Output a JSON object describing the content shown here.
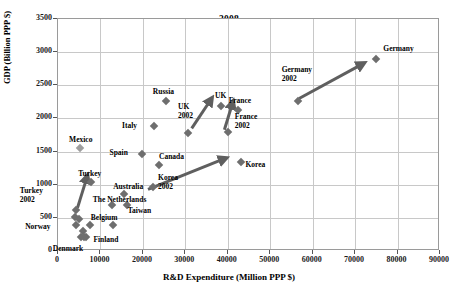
{
  "chart_data": {
    "type": "scatter",
    "title": "2008",
    "xlabel": "R&D Expenditure (Million PPP $)",
    "ylabel": "GDP (Billion PPP $)",
    "xlim": [
      0,
      90000
    ],
    "ylim": [
      0,
      3500
    ],
    "xticks": [
      0,
      10000,
      20000,
      30000,
      40000,
      50000,
      60000,
      70000,
      80000,
      90000
    ],
    "yticks": [
      0,
      500,
      1000,
      1500,
      2000,
      2500,
      3000,
      3500
    ],
    "grid": true,
    "legend": "none",
    "marker_color": "#6e6e6e",
    "arrow_color": "#5f5f5f",
    "points": [
      {
        "label": "Germany",
        "x": 75000,
        "y": 2900,
        "label_dx": 8,
        "label_dy": -14
      },
      {
        "label": "Germany\n2002",
        "x": 56500,
        "y": 2270,
        "label_dx": -6,
        "label_dy": -26
      },
      {
        "label": "France",
        "x": 42500,
        "y": 2130,
        "label_dx": -2,
        "label_dy": -13
      },
      {
        "label": "France\n2002",
        "x": 40000,
        "y": 1790,
        "label_dx": 8,
        "label_dy": -10
      },
      {
        "label": "UK",
        "x": 38500,
        "y": 2190,
        "label_dx": -2,
        "label_dy": -14
      },
      {
        "label": "UK\n2002",
        "x": 30500,
        "y": 1780,
        "label_dx": -4,
        "label_dy": -21
      },
      {
        "label": "Russia",
        "x": 25500,
        "y": 2260,
        "label_dx": -6,
        "label_dy": -13
      },
      {
        "label": "Italy",
        "x": 22500,
        "y": 1880,
        "label_dx": -26,
        "label_dy": -4
      },
      {
        "label": "Spain",
        "x": 19800,
        "y": 1470,
        "label_dx": -26,
        "label_dy": -5
      },
      {
        "label": "Canada",
        "x": 23800,
        "y": 1300,
        "label_dx": 1,
        "label_dy": -12
      },
      {
        "label": "Korea",
        "x": 43000,
        "y": 1350,
        "label_dx": 6,
        "label_dy": -1
      },
      {
        "label": "Korea\n2002",
        "x": 22400,
        "y": 960,
        "label_dx": 6,
        "label_dy": -4
      },
      {
        "label": "Turkey",
        "x": 7800,
        "y": 1040,
        "label_dx": -5,
        "label_dy": -12
      },
      {
        "label": "Turkey\n2002",
        "x": 4200,
        "y": 620,
        "label_dx": -48,
        "label_dy": -14
      },
      {
        "label": "Mexico",
        "x": 5200,
        "y": 1550,
        "label_dx": -3,
        "label_dy": -12
      },
      {
        "label": "Australia",
        "x": 15600,
        "y": 860,
        "label_dx": -1,
        "label_dy": -11
      },
      {
        "label": "The Netherlands",
        "x": 12700,
        "y": 700,
        "label_dx": -2,
        "label_dy": -9
      },
      {
        "label": "Taiwan",
        "x": 16200,
        "y": 700,
        "label_dx": 2,
        "label_dy": 2
      },
      {
        "label": "Belgium",
        "x": 7500,
        "y": 400,
        "label_dx": 2,
        "label_dy": -11
      },
      {
        "label": "Norway",
        "x": 4200,
        "y": 400,
        "label_dx": -42,
        "label_dy": -2
      },
      {
        "label": "Finland",
        "x": 6700,
        "y": 210,
        "label_dx": 8,
        "label_dy": -1
      },
      {
        "label": "Denmark",
        "x": 5400,
        "y": 210,
        "label_dx": -18,
        "label_dy": 8
      },
      {
        "label": "",
        "x": 12900,
        "y": 390,
        "label_dx": 0,
        "label_dy": 0
      },
      {
        "label": "",
        "x": 4000,
        "y": 520,
        "label_dx": 0,
        "label_dy": 0
      },
      {
        "label": "",
        "x": 5000,
        "y": 480,
        "label_dx": 0,
        "label_dy": 0
      },
      {
        "label": "",
        "x": 5900,
        "y": 300,
        "label_dx": 0,
        "label_dy": 0
      },
      {
        "label": "",
        "x": 6100,
        "y": 210,
        "label_dx": 0,
        "label_dy": 0
      }
    ],
    "arrows": [
      {
        "name": "turkey-growth-arrow",
        "x1": 4600,
        "y1": 650,
        "x2": 6900,
        "y2": 1130
      },
      {
        "name": "korea-growth-arrow",
        "x1": 21200,
        "y1": 930,
        "x2": 39500,
        "y2": 1400
      },
      {
        "name": "uk-growth-arrow",
        "x1": 31500,
        "y1": 1850,
        "x2": 36200,
        "y2": 2300
      },
      {
        "name": "france-growth-arrow",
        "x1": 39200,
        "y1": 1830,
        "x2": 41200,
        "y2": 2250
      },
      {
        "name": "germany-growth-arrow",
        "x1": 56800,
        "y1": 2300,
        "x2": 72000,
        "y2": 2830
      }
    ]
  }
}
